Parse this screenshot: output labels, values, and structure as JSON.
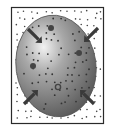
{
  "diagram": {
    "colors": {
      "background": "#ffffff",
      "frame": "#2a2a2a",
      "cell_dark": "#5c5c5c",
      "cell_light": "#e8e8e8",
      "particle": "#333333",
      "arrow": "#3a3a3a"
    },
    "arrows": [
      {
        "name": "arrow-top-left",
        "direction": "inward"
      },
      {
        "name": "arrow-top-right",
        "direction": "inward"
      },
      {
        "name": "arrow-bottom-left",
        "direction": "inward"
      },
      {
        "name": "arrow-bottom-right",
        "direction": "inward"
      }
    ]
  }
}
